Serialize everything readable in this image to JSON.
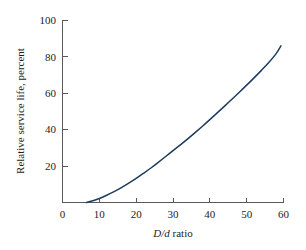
{
  "chart_data": {
    "type": "line",
    "title": "",
    "subtitle": "",
    "xlabel_italic": "D/d",
    "xlabel_roman": " ratio",
    "xlabel": "D/d ratio",
    "ylabel": "Relative service life, percent",
    "xlim": [
      0,
      60
    ],
    "ylim": [
      0,
      100
    ],
    "xticks": [
      0,
      10,
      20,
      30,
      40,
      50,
      60
    ],
    "yticks": [
      0,
      20,
      40,
      60,
      80,
      100
    ],
    "xtick_labels": [
      "0",
      "10",
      "20",
      "30",
      "40",
      "50",
      "60"
    ],
    "ytick_labels": [
      "0",
      "20",
      "40",
      "60",
      "80",
      "100"
    ],
    "grid": false,
    "legend": false,
    "legend_position": "none",
    "series": [
      {
        "name": "Relative service life",
        "color": "#1d3c5c",
        "x": [
          6.5,
          8,
          10,
          12,
          14,
          16,
          18,
          20,
          22,
          24,
          26,
          28,
          30,
          32,
          34,
          36,
          38,
          40,
          42,
          44,
          46,
          48,
          50,
          52,
          54,
          56,
          58,
          59.3
        ],
        "y": [
          0,
          0.8,
          2.2,
          4.0,
          6.0,
          8.2,
          10.6,
          13.2,
          16.0,
          18.9,
          22.0,
          25.2,
          28.4,
          31.6,
          34.9,
          38.3,
          41.8,
          45.4,
          49.1,
          52.8,
          56.6,
          60.4,
          64.3,
          68.3,
          72.4,
          76.7,
          81.6,
          85.8
        ]
      }
    ],
    "annotations": []
  },
  "figure": {
    "background_color": "#ffffff",
    "axis_color": "#5a5a5a",
    "text_color": "#1c1c1c",
    "accent_color": "#1d3c5c"
  }
}
